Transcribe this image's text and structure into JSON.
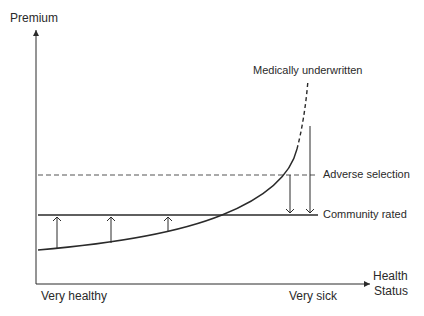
{
  "diagram": {
    "y_axis_label": "Premium",
    "x_axis_label_line1": "Health",
    "x_axis_label_line2": "Status",
    "x_left_label": "Very healthy",
    "x_right_label": "Very sick",
    "curves": {
      "medically_underwritten": "Medically underwritten",
      "adverse_selection": "Adverse selection",
      "community_rated": "Community rated"
    },
    "colors": {
      "line": "#2a2a2a",
      "dashed": "#555555"
    }
  }
}
